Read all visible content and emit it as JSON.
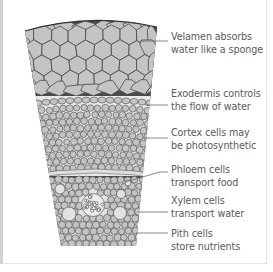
{
  "labels": [
    {
      "line1": "Velamen absorbs",
      "line2": "water like a sponge"
    },
    {
      "line1": "Exodermis controls",
      "line2": "the flow of water"
    },
    {
      "line1": "Cortex cells may",
      "line2": "be photosynthetic"
    },
    {
      "line1": "Phloem cells",
      "line2": "transport food"
    },
    {
      "line1": "Xylem cells",
      "line2": "transport water"
    },
    {
      "line1": "Pith cells",
      "line2": "store nutrients"
    }
  ],
  "colors": {
    "cell_fill": "#c4c4c4",
    "cell_outline": "#4a4a4a",
    "pale_cell": "#e2e2e2",
    "label_text": "#5a5a5a",
    "leader_line": "#6a6a6a"
  }
}
